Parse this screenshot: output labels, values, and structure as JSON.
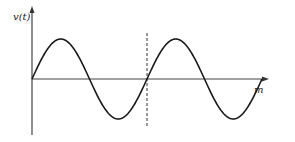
{
  "figure": {
    "y_axis_label": "v(t)",
    "x_axis_label": "m",
    "colors": {
      "curve": "#1a1a1a",
      "axis": "#444444",
      "dashed": "#333333",
      "background": "#ffffff"
    }
  },
  "chart_data": {
    "type": "line",
    "title": "",
    "xlabel": "m",
    "ylabel": "v(t)",
    "series": [
      {
        "name": "v(t)",
        "function": "sin",
        "periods": 2
      }
    ],
    "annotations": [
      {
        "type": "vertical-dashed-line",
        "position": "end of first period (phase 2π)"
      }
    ],
    "grid": false
  }
}
